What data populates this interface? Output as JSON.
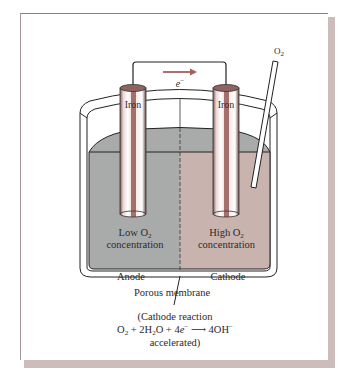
{
  "figure": {
    "type": "electrochemical differential aeration cell",
    "electron_label": "e",
    "electron_charge": "−",
    "gas_label": "O",
    "gas_subscript": "2",
    "electrodes": [
      {
        "id": "left",
        "label": "Iron"
      },
      {
        "id": "right",
        "label": "Iron"
      }
    ],
    "compartments": [
      {
        "id": "left",
        "line1_prefix": "Low O",
        "line1_subscript": "2",
        "line2": "concentration",
        "role": "Anode"
      },
      {
        "id": "right",
        "line1_prefix": "High O",
        "line1_subscript": "2",
        "line2": "concentration",
        "role": "Cathode"
      }
    ],
    "membrane_label": "Porous membrane",
    "reaction": {
      "line1": "(Cathode reaction",
      "eq_o": "O",
      "eq_o_sub": "2",
      "eq_plus1": " + 2H",
      "eq_h_sub": "2",
      "eq_water_tail": "O + 4",
      "eq_e": "e",
      "eq_e_sup": "−",
      "eq_arrow": " ⟶ ",
      "eq_product": "4OH",
      "eq_product_sup": "−",
      "line3": "accelerated)"
    },
    "colors": {
      "anode_solution": "#a9abaa",
      "cathode_solution": "#c8b3af",
      "electrode_stripe": "#a5706c",
      "electrode_top": "#8f6460",
      "arrow": "#a5605c",
      "frame_shadow": "#cdbcbc"
    }
  }
}
